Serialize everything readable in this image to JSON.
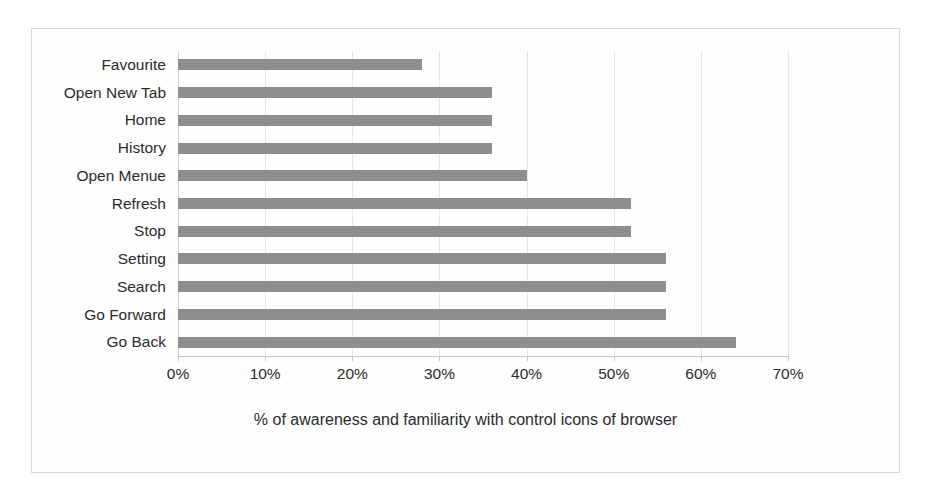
{
  "chart_data": {
    "type": "bar",
    "orientation": "horizontal",
    "title": "",
    "subtitle": "",
    "xlabel": "% of awareness and familiarity with control icons of browser",
    "ylabel": "",
    "categories": [
      "Favourite",
      "Open New Tab",
      "Home",
      "History",
      "Open Menue",
      "Refresh",
      "Stop",
      "Setting",
      "Search",
      "Go Forward",
      "Go Back"
    ],
    "values": [
      28,
      36,
      36,
      36,
      40,
      52,
      52,
      56,
      56,
      56,
      64
    ],
    "value_unit": "%",
    "xlim": [
      0,
      70
    ],
    "xticks": [
      0,
      10,
      20,
      30,
      40,
      50,
      60,
      70
    ],
    "xtick_labels": [
      "0%",
      "10%",
      "20%",
      "30%",
      "40%",
      "50%",
      "60%",
      "70%"
    ],
    "grid": true,
    "grid_axis": "x",
    "legend": false,
    "legend_position": "none",
    "bar_color": "#8e8e8e",
    "plot_background": "#fefefe",
    "border_color": "#d9d9d9"
  }
}
